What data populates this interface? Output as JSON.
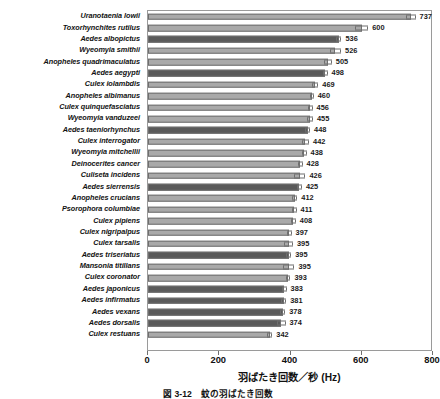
{
  "chart_data": {
    "type": "bar",
    "orientation": "horizontal",
    "title": "",
    "xlabel": "羽ばたき回数／秒 (Hz)",
    "ylabel": "",
    "xlim": [
      0,
      800
    ],
    "xticks": [
      0,
      200,
      400,
      600,
      800
    ],
    "grid": false,
    "legend": null,
    "categories": [
      "Uranotaenia lowii",
      "Toxorhynchites rutilus",
      "Aedes albopictus",
      "Wyeomyia smithii",
      "Anopheles quadrimaculatus",
      "Aedes aegypti",
      "Culex iolambdis",
      "Anopheles albimanus",
      "Culex quinquefasciatus",
      "Wyeomyia vanduzeei",
      "Aedes taeniorhynchus",
      "Culex interrogator",
      "Wyeomyia mitchellii",
      "Deinocerites cancer",
      "Culiseta incidens",
      "Aedes sierrensis",
      "Anopheles crucians",
      "Psorophora columbiae",
      "Culex pipiens",
      "Culex nigripalpus",
      "Culex tarsalis",
      "Aedes triseriatus",
      "Mansonia titillans",
      "Culex coronator",
      "Aedes japonicus",
      "Aedes infirmatus",
      "Aedes vexans",
      "Aedes dorsalis",
      "Culex restuans"
    ],
    "values": [
      737,
      600,
      536,
      526,
      505,
      498,
      469,
      460,
      456,
      455,
      448,
      442,
      438,
      428,
      426,
      425,
      412,
      411,
      408,
      397,
      395,
      395,
      395,
      393,
      383,
      381,
      378,
      374,
      342
    ],
    "value_labels": [
      "737",
      "600",
      "536",
      "526",
      "505",
      "498",
      "469",
      "460",
      "456",
      "455",
      "448",
      "442",
      "438",
      "428",
      "426",
      "425",
      "412",
      "411",
      "408",
      "397",
      "395",
      "395",
      "395",
      "393",
      "383",
      "381",
      "378",
      "374",
      "342"
    ],
    "errors": [
      14,
      18,
      7,
      16,
      11,
      6,
      9,
      5,
      6,
      8,
      7,
      10,
      7,
      6,
      16,
      7,
      7,
      6,
      7,
      6,
      12,
      7,
      16,
      7,
      6,
      7,
      7,
      12,
      7
    ],
    "highlighted_genus": "Aedes",
    "colors": {
      "bar_light": "#a9a9a9",
      "bar_dark": "#5a5a5a",
      "bar_outline": "#6f6f6f",
      "axis": "#9a9a9a",
      "text": "#111111"
    }
  },
  "caption": "図 3-12　蚊の羽ばたき回数"
}
